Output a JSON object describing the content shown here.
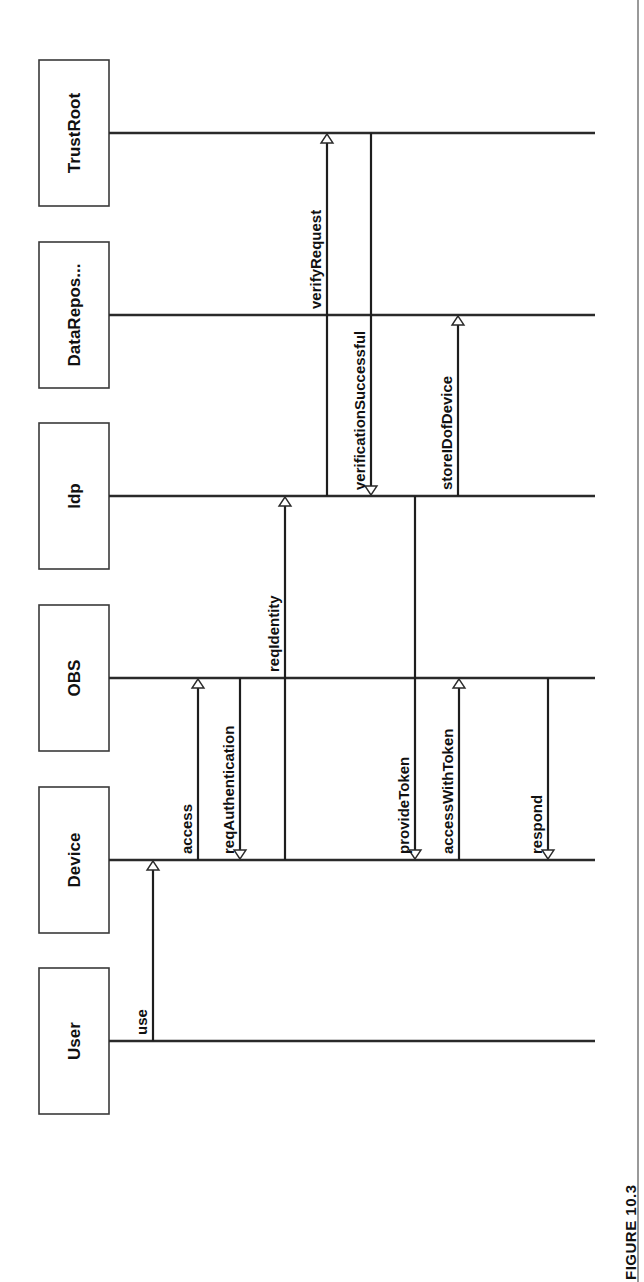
{
  "figure": {
    "caption": "FIGURE 10.3",
    "orientation": "rotated-90-ccw",
    "colors": {
      "line": "#2a2a2a",
      "text": "#111111",
      "background": "#ffffff"
    }
  },
  "actors": [
    {
      "id": "TrustRoot",
      "label": "TrustRoot",
      "y": 133
    },
    {
      "id": "DataRepos",
      "label": "DataRepos...",
      "y": 315
    },
    {
      "id": "Idp",
      "label": "Idp",
      "y": 496
    },
    {
      "id": "OBS",
      "label": "OBS",
      "y": 678
    },
    {
      "id": "Device",
      "label": "Device",
      "y": 860
    },
    {
      "id": "User",
      "label": "User",
      "y": 1041
    }
  ],
  "messages": [
    {
      "order": 1,
      "label": "use",
      "from": "User",
      "to": "Device",
      "x": 153
    },
    {
      "order": 2,
      "label": "access",
      "from": "Device",
      "to": "OBS",
      "x": 198
    },
    {
      "order": 3,
      "label": "reqAuthentication",
      "from": "OBS",
      "to": "Device",
      "x": 240
    },
    {
      "order": 4,
      "label": "reqIdentity",
      "from": "Device",
      "to": "Idp",
      "x": 285
    },
    {
      "order": 5,
      "label": "verifyRequest",
      "from": "Idp",
      "to": "TrustRoot",
      "x": 327
    },
    {
      "order": 6,
      "label": "verificationSuccessful",
      "from": "TrustRoot",
      "to": "Idp",
      "x": 371
    },
    {
      "order": 7,
      "label": "provideToken",
      "from": "Idp",
      "to": "Device",
      "x": 415
    },
    {
      "order": 8,
      "label": "storeIDofDevice",
      "from": "Idp",
      "to": "DataRepos",
      "x": 458
    },
    {
      "order": 9,
      "label": "accessWithToken",
      "from": "Device",
      "to": "OBS",
      "x": 459
    },
    {
      "order": 10,
      "label": "respond",
      "from": "OBS",
      "to": "Device",
      "x": 548
    }
  ]
}
